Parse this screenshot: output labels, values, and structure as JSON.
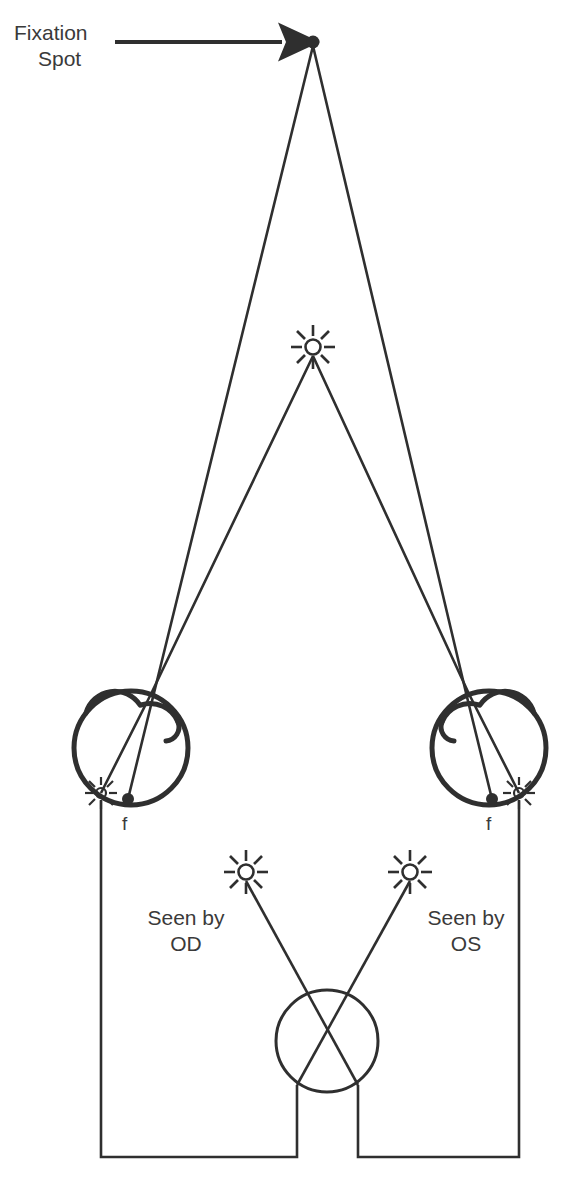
{
  "diagram": {
    "title_visible": false,
    "stroke_color": "#2f2f2f",
    "background_color": "#ffffff",
    "annotations": {
      "fixation_label_line1": "Fixation",
      "fixation_label_line2": "Spot",
      "left_eye_fovea_label": "f",
      "right_eye_fovea_label": "f",
      "seen_by_od_line1": "Seen by",
      "seen_by_od_line2": "OD",
      "seen_by_os_line1": "Seen by",
      "seen_by_os_line2": "OS"
    },
    "elements": {
      "fixation_spot": {
        "name": "fixation-spot-dot",
        "x": 313,
        "y": 42,
        "r": 6
      },
      "pointer_arrow": {
        "name": "fixation-arrow",
        "x1": 115,
        "y1": 42,
        "x2": 292,
        "y2": 42
      },
      "central_light": {
        "name": "central-light-starburst",
        "x": 313,
        "y": 347,
        "r": 7
      },
      "left_eye": {
        "name": "left-eye-globe",
        "cx": 131,
        "cy": 748,
        "r": 57
      },
      "right_eye": {
        "name": "right-eye-globe",
        "cx": 489,
        "cy": 748,
        "r": 57
      },
      "left_eye_reflex": {
        "name": "left-eye-image-starburst",
        "x": 101,
        "y": 793,
        "r": 5
      },
      "right_eye_reflex": {
        "name": "right-eye-image-starburst",
        "x": 519,
        "y": 793,
        "r": 5
      },
      "left_fovea_dot": {
        "name": "left-fovea-dot",
        "x": 128,
        "y": 799,
        "r": 5
      },
      "right_fovea_dot": {
        "name": "right-fovea-dot",
        "x": 492,
        "y": 799,
        "r": 5
      },
      "od_percept_light": {
        "name": "od-perceived-light-starburst",
        "x": 246,
        "y": 872,
        "r": 7
      },
      "os_percept_light": {
        "name": "os-perceived-light-starburst",
        "x": 410,
        "y": 872,
        "r": 7
      },
      "observer_head_circle": {
        "name": "observer-head-circle",
        "cx": 327,
        "cy": 1041,
        "r": 51
      },
      "projection_frame_left": {
        "name": "projection-frame-left",
        "x1": 101,
        "y1": 800,
        "x2": 297,
        "y2": 1157
      },
      "projection_frame_right": {
        "name": "projection-frame-right",
        "x1": 358,
        "y1": 1157,
        "x2": 519,
        "y2": 800
      }
    }
  }
}
